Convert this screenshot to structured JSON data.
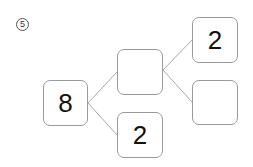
{
  "problem": {
    "number": "5",
    "number_glyph": "⑤"
  },
  "tree": {
    "root": {
      "value": "8"
    },
    "middle": {
      "value": ""
    },
    "bottom": {
      "value": "2"
    },
    "top_right": {
      "value": "2"
    },
    "bottom_right": {
      "value": ""
    }
  },
  "colors": {
    "box_border": "#9a9a9a",
    "line": "#a8a8a8",
    "text": "#111111"
  }
}
